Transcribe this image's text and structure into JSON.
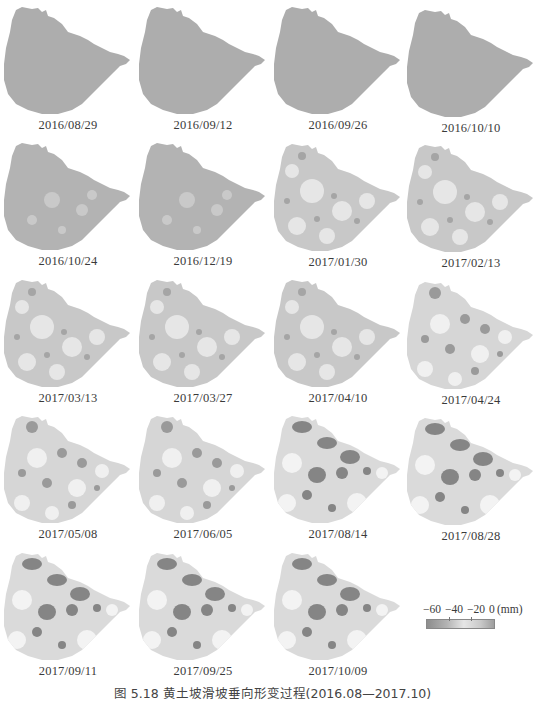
{
  "figure": {
    "caption": "图 5.18   黄土坡滑坡垂向形变过程(2016.08—2017.10)",
    "panels": [
      {
        "date": "2016/08/29",
        "tone": 0
      },
      {
        "date": "2016/09/12",
        "tone": 0
      },
      {
        "date": "2016/09/26",
        "tone": 0
      },
      {
        "date": "2016/10/10",
        "tone": 0
      },
      {
        "date": "2016/10/24",
        "tone": 1
      },
      {
        "date": "2016/12/19",
        "tone": 1
      },
      {
        "date": "2017/01/30",
        "tone": 2
      },
      {
        "date": "2017/02/13",
        "tone": 2
      },
      {
        "date": "2017/03/13",
        "tone": 2
      },
      {
        "date": "2017/03/27",
        "tone": 2
      },
      {
        "date": "2017/04/10",
        "tone": 2
      },
      {
        "date": "2017/04/24",
        "tone": 3
      },
      {
        "date": "2017/05/08",
        "tone": 3
      },
      {
        "date": "2017/06/05",
        "tone": 3
      },
      {
        "date": "2017/08/14",
        "tone": 4
      },
      {
        "date": "2017/08/28",
        "tone": 4
      },
      {
        "date": "2017/09/11",
        "tone": 4
      },
      {
        "date": "2017/09/25",
        "tone": 4
      },
      {
        "date": "2017/10/09",
        "tone": 4
      }
    ]
  },
  "legend": {
    "ticks": [
      "−60",
      "−40",
      "−20",
      "0"
    ],
    "unit": "(mm)",
    "range": [
      -60,
      0
    ]
  }
}
